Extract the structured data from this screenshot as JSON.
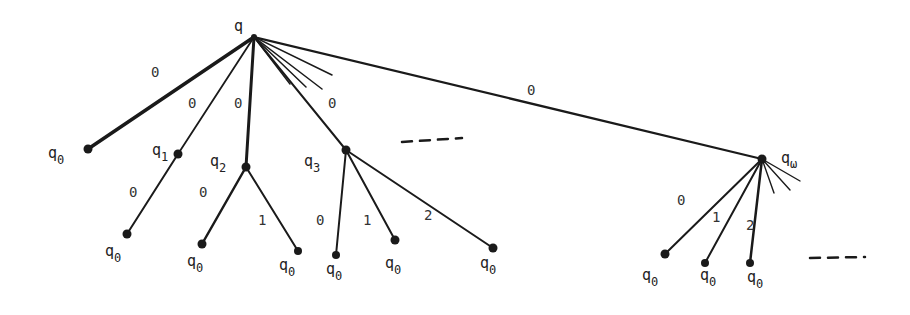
{
  "diagram": {
    "type": "tree",
    "root": {
      "label": "q",
      "sub": ""
    },
    "nodes": {
      "q": {
        "label": "q",
        "sub": ""
      },
      "q0a": {
        "label": "q",
        "sub": "0"
      },
      "q1": {
        "label": "q",
        "sub": "1"
      },
      "q2": {
        "label": "q",
        "sub": "2"
      },
      "q3": {
        "label": "q",
        "sub": "3"
      },
      "qw": {
        "label": "q",
        "sub": "ω"
      },
      "l1": {
        "label": "q",
        "sub": "0"
      },
      "l2a": {
        "label": "q",
        "sub": "0"
      },
      "l2b": {
        "label": "q",
        "sub": "0"
      },
      "l3a": {
        "label": "q",
        "sub": "0"
      },
      "l3b": {
        "label": "q",
        "sub": "0"
      },
      "l3c": {
        "label": "q",
        "sub": "0"
      },
      "lwa": {
        "label": "q",
        "sub": "0"
      },
      "lwb": {
        "label": "q",
        "sub": "0"
      },
      "lwc": {
        "label": "q",
        "sub": "0"
      }
    },
    "edges": [
      {
        "from": "q",
        "to": "q0a",
        "label": "0"
      },
      {
        "from": "q",
        "to": "q1",
        "label": "0"
      },
      {
        "from": "q",
        "to": "q2",
        "label": "0"
      },
      {
        "from": "q",
        "to": "q3",
        "label": "0"
      },
      {
        "from": "q",
        "to": "qw",
        "label": "0"
      },
      {
        "from": "q1",
        "to": "l1",
        "label": "0"
      },
      {
        "from": "q2",
        "to": "l2a",
        "label": "0"
      },
      {
        "from": "q2",
        "to": "l2b",
        "label": "1"
      },
      {
        "from": "q3",
        "to": "l3a",
        "label": "0"
      },
      {
        "from": "q3",
        "to": "l3b",
        "label": "1"
      },
      {
        "from": "q3",
        "to": "l3c",
        "label": "2"
      },
      {
        "from": "qw",
        "to": "lwa",
        "label": "0"
      },
      {
        "from": "qw",
        "to": "lwb",
        "label": "1"
      },
      {
        "from": "qw",
        "to": "lwc",
        "label": "2"
      }
    ],
    "ellipsis": [
      "- - -",
      "- - -"
    ]
  }
}
